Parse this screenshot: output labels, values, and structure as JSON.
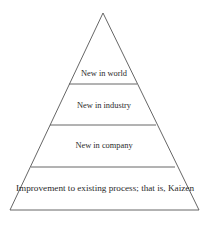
{
  "diagram": {
    "type": "pyramid",
    "levels": [
      {
        "label": "New in world"
      },
      {
        "label": "New in industry"
      },
      {
        "label": "New in company"
      },
      {
        "label": "Improvement to existing process; that is, Kaizen"
      }
    ],
    "colors": {
      "stroke": "#555555",
      "text": "#2a2a2a",
      "background": "#ffffff"
    }
  }
}
